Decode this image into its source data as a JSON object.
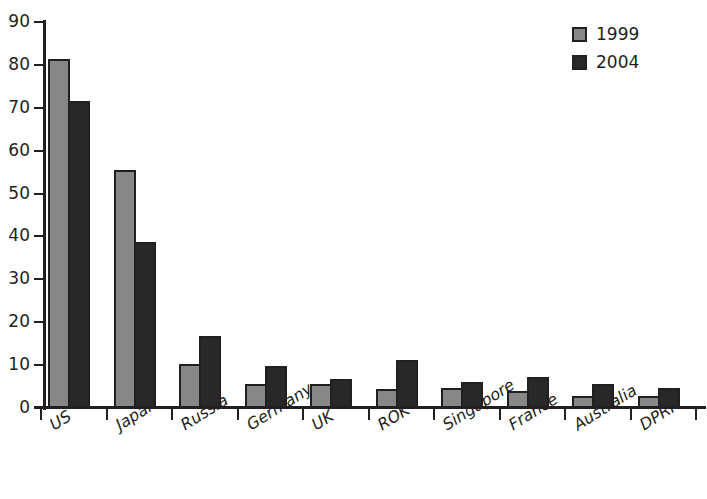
{
  "chart_data": {
    "type": "bar",
    "title": "",
    "subtitle": "",
    "xlabel": "",
    "ylabel": "",
    "ylim": [
      0,
      90
    ],
    "ytick_step": 10,
    "yticks": [
      0,
      10,
      20,
      30,
      40,
      50,
      60,
      70,
      80,
      90
    ],
    "grid": false,
    "legend_position": "top-right",
    "categories": [
      "US",
      "Japan",
      "Russia",
      "Germany",
      "UK",
      "ROK",
      "Singapore",
      "France",
      "Australia",
      "DPRK"
    ],
    "series": [
      {
        "name": "1999",
        "color": "#878787",
        "values": [
          81.3,
          55.4,
          10.3,
          5.5,
          5.7,
          4.5,
          4.7,
          3.9,
          2.7,
          2.7
        ]
      },
      {
        "name": "2004",
        "color": "#282828",
        "values": [
          71.5,
          38.7,
          16.7,
          9.7,
          6.7,
          11.3,
          6.1,
          7.3,
          5.7,
          4.6
        ]
      }
    ]
  },
  "legend": {
    "items": [
      {
        "label": "1999",
        "series_class": "s1999"
      },
      {
        "label": "2004",
        "series_class": "s2004"
      }
    ]
  }
}
